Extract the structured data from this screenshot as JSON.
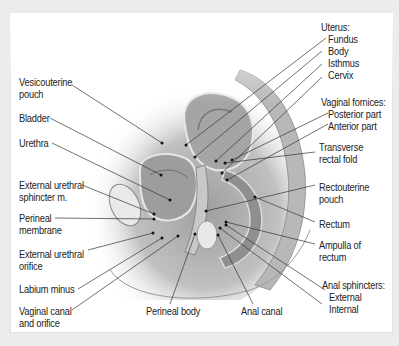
{
  "figure": {
    "type": "anatomical sagittal section",
    "colors": {
      "frame": "#ececec",
      "panel": "#ffffff",
      "text": "#222222",
      "leader": "#333333",
      "tissue": "#9a9a9a"
    }
  },
  "labels_left": {
    "vesicouterine_pouch": {
      "line1": "Vesicouterine",
      "line2": "pouch"
    },
    "bladder": "Bladder",
    "urethra": "Urethra",
    "external_urethral_sphincter": {
      "line1": "External urethral",
      "line2": "sphincter m."
    },
    "perineal_membrane": {
      "line1": "Perineal",
      "line2": "membrane"
    },
    "external_urethral_orifice": {
      "line1": "External urethral",
      "line2": "orifice"
    },
    "labium_minus": "Labium minus",
    "vaginal_canal": {
      "line1": "Vaginal canal",
      "line2": "and orifice"
    }
  },
  "labels_bottom": {
    "perineal_body": "Perineal body",
    "anal_canal": "Anal canal"
  },
  "labels_right": {
    "uterus": {
      "header": "Uterus:",
      "items": [
        "Fundus",
        "Body",
        "Isthmus",
        "Cervix"
      ]
    },
    "vaginal_fornices": {
      "header": "Vaginal fornices:",
      "items": [
        "Posterior part",
        "Anterior part"
      ]
    },
    "transverse_rectal_fold": {
      "line1": "Transverse",
      "line2": "rectal fold"
    },
    "rectouterine_pouch": {
      "line1": "Rectouterine",
      "line2": "pouch"
    },
    "rectum": "Rectum",
    "ampulla": {
      "line1": "Ampulla of",
      "line2": "rectum"
    },
    "anal_sphincters": {
      "header": "Anal sphincters:",
      "items": [
        "External",
        "Internal"
      ]
    }
  }
}
